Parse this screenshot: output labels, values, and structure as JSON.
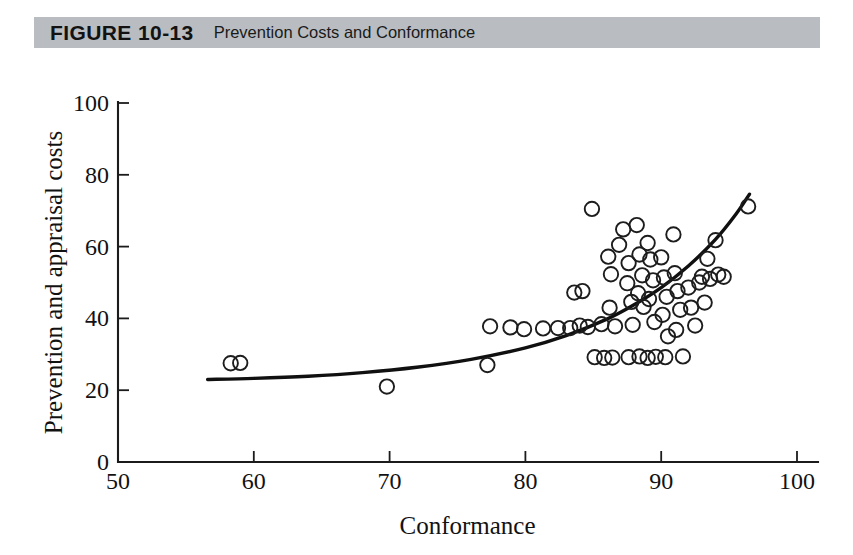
{
  "figure": {
    "number_label": "FIGURE 10-13",
    "caption": "Prevention Costs and Conformance",
    "header_background": "#b9bdc1",
    "page_background": "#ffffff"
  },
  "chart_data": {
    "type": "scatter",
    "title": "Prevention Costs and Conformance",
    "xlabel": "Conformance",
    "ylabel": "Prevention and appraisal costs",
    "xlim": [
      50,
      100
    ],
    "ylim": [
      0,
      100
    ],
    "xticks": [
      50,
      60,
      70,
      80,
      90,
      100
    ],
    "yticks": [
      0,
      20,
      40,
      60,
      80,
      100
    ],
    "grid": false,
    "legend": null,
    "marker_style": "open-circle",
    "marker_color": "#1d1d1d",
    "series": [
      {
        "name": "Observations",
        "points": [
          [
            58.3,
            27.5
          ],
          [
            59.0,
            27.6
          ],
          [
            69.8,
            21.0
          ],
          [
            77.2,
            27.0
          ],
          [
            77.4,
            37.8
          ],
          [
            78.9,
            37.5
          ],
          [
            79.9,
            37.0
          ],
          [
            81.3,
            37.2
          ],
          [
            82.4,
            37.3
          ],
          [
            83.3,
            37.3
          ],
          [
            83.6,
            47.2
          ],
          [
            84.2,
            47.6
          ],
          [
            84.0,
            38.0
          ],
          [
            84.6,
            37.6
          ],
          [
            84.9,
            70.5
          ],
          [
            85.1,
            29.2
          ],
          [
            85.8,
            29.0
          ],
          [
            86.4,
            29.1
          ],
          [
            85.6,
            38.4
          ],
          [
            86.2,
            43.0
          ],
          [
            86.6,
            37.8
          ],
          [
            86.1,
            57.2
          ],
          [
            86.3,
            52.3
          ],
          [
            86.9,
            60.5
          ],
          [
            87.2,
            64.8
          ],
          [
            87.6,
            55.4
          ],
          [
            87.5,
            49.8
          ],
          [
            87.8,
            44.6
          ],
          [
            87.9,
            38.2
          ],
          [
            87.6,
            29.2
          ],
          [
            88.2,
            66.0
          ],
          [
            88.4,
            57.8
          ],
          [
            88.6,
            52.0
          ],
          [
            88.3,
            47.0
          ],
          [
            88.7,
            43.2
          ],
          [
            88.4,
            29.4
          ],
          [
            89.0,
            61.0
          ],
          [
            89.2,
            56.4
          ],
          [
            89.4,
            50.6
          ],
          [
            89.1,
            45.4
          ],
          [
            89.5,
            39.0
          ],
          [
            89.0,
            29.0
          ],
          [
            89.6,
            29.3
          ],
          [
            90.0,
            57.0
          ],
          [
            90.2,
            51.4
          ],
          [
            90.4,
            46.0
          ],
          [
            90.1,
            41.0
          ],
          [
            90.5,
            35.0
          ],
          [
            90.3,
            29.2
          ],
          [
            90.9,
            63.4
          ],
          [
            91.0,
            52.6
          ],
          [
            91.2,
            47.6
          ],
          [
            91.4,
            42.4
          ],
          [
            91.1,
            36.8
          ],
          [
            91.6,
            29.4
          ],
          [
            92.0,
            48.6
          ],
          [
            92.2,
            43.0
          ],
          [
            92.5,
            38.0
          ],
          [
            92.8,
            50.0
          ],
          [
            93.2,
            44.4
          ],
          [
            93.0,
            51.6
          ],
          [
            93.6,
            51.0
          ],
          [
            93.4,
            56.6
          ],
          [
            94.0,
            61.8
          ],
          [
            94.2,
            52.2
          ],
          [
            94.6,
            51.6
          ],
          [
            96.4,
            71.2
          ]
        ]
      }
    ],
    "fit_curve": {
      "name": "Exponential trend",
      "style": "solid",
      "color": "#101010",
      "points": [
        [
          56.6,
          23.0
        ],
        [
          60.0,
          23.3
        ],
        [
          64.0,
          23.9
        ],
        [
          68.0,
          24.9
        ],
        [
          72.0,
          26.4
        ],
        [
          76.0,
          28.6
        ],
        [
          80.0,
          31.8
        ],
        [
          83.0,
          35.2
        ],
        [
          86.0,
          39.8
        ],
        [
          88.0,
          43.8
        ],
        [
          90.0,
          48.6
        ],
        [
          92.0,
          54.6
        ],
        [
          94.0,
          62.0
        ],
        [
          95.5,
          69.0
        ],
        [
          96.5,
          74.6
        ]
      ]
    }
  }
}
